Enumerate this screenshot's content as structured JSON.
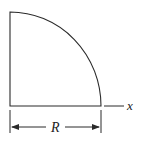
{
  "diagram": {
    "shape": "quarter-circle",
    "labels": {
      "axis": "x",
      "dimension": "R"
    },
    "colors": {
      "stroke": "#2a2a2a",
      "background": "#ffffff"
    }
  }
}
